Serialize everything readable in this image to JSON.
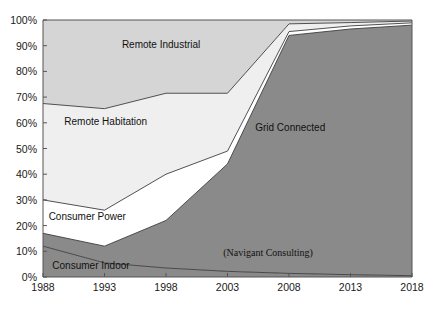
{
  "chart": {
    "source_note": "(Navigant Consulting)",
    "cut_off_title_fragment": "",
    "axes": {
      "y_ticks": [
        "0%",
        "10%",
        "20%",
        "30%",
        "40%",
        "50%",
        "60%",
        "70%",
        "80%",
        "90%",
        "100%"
      ],
      "x_ticks": [
        "1988",
        "1993",
        "1998",
        "2003",
        "2008",
        "2013",
        "2018"
      ],
      "xlim": [
        1988,
        2018
      ],
      "ylim": [
        0,
        100
      ],
      "grid": false
    },
    "series_labels": [
      {
        "name": "Remote Industrial",
        "x_pct": 32,
        "y_pct": 89
      },
      {
        "name": "Remote Habitation",
        "x_pct": 17,
        "y_pct": 59
      },
      {
        "name": "Consumer Power",
        "x_pct": 12,
        "y_pct": 22
      },
      {
        "name": "Consumer Indoor",
        "x_pct": 13,
        "y_pct": 3
      },
      {
        "name": "Grid Connected",
        "x_pct": 67,
        "y_pct": 57
      }
    ]
  },
  "chart_data": {
    "type": "area",
    "title": "",
    "subtitle": "",
    "xlabel": "",
    "ylabel": "",
    "stacked": true,
    "normalized": true,
    "xlim": [
      1988,
      2018
    ],
    "ylim": [
      0,
      100
    ],
    "grid": false,
    "legend": "inline-annotations",
    "annotations": [
      "(Navigant Consulting)"
    ],
    "x": [
      1988,
      1993,
      1998,
      2003,
      2008,
      2013,
      2018
    ],
    "xtick_labels": [
      "1988",
      "1993",
      "1998",
      "2003",
      "2008",
      "2013",
      "2018"
    ],
    "ytick_labels": [
      "0%",
      "10%",
      "20%",
      "30%",
      "40%",
      "50%",
      "60%",
      "70%",
      "80%",
      "90%",
      "100%"
    ],
    "series": [
      {
        "name": "Consumer Indoor",
        "color": "#8a8a8a",
        "values": [
          12,
          5.5,
          3.5,
          2.2,
          1.4,
          0.9,
          0.5
        ]
      },
      {
        "name": "Grid Connected",
        "color": "#8a8a8a",
        "values": [
          5,
          6.5,
          18.5,
          41.8,
          92.6,
          95.6,
          97.5
        ]
      },
      {
        "name": "Consumer Power",
        "color": "#ffffff",
        "values": [
          13,
          14,
          18,
          5,
          1.5,
          1.2,
          0.9
        ]
      },
      {
        "name": "Remote Habitation",
        "color": "#efefef",
        "values": [
          37.5,
          39.5,
          31.5,
          22.5,
          3.0,
          1.3,
          0.7
        ]
      },
      {
        "name": "Remote Industrial",
        "color": "#d5d5d5",
        "values": [
          32.5,
          34.5,
          28.5,
          28.5,
          1.5,
          1.0,
          0.4
        ]
      }
    ],
    "cumulative_tops": {
      "consumer_indoor": [
        12,
        5.5,
        3.5,
        2.2,
        1.4,
        0.9,
        0.5
      ],
      "grid_connected": [
        17,
        12,
        22,
        44,
        94,
        96.5,
        98
      ],
      "consumer_power": [
        30,
        26,
        40,
        49,
        95.5,
        97.7,
        98.9
      ],
      "remote_habitation": [
        67.5,
        65.5,
        71.5,
        71.5,
        98.5,
        99.0,
        99.6
      ],
      "remote_industrial": [
        100,
        100,
        100,
        100,
        100,
        100,
        100
      ]
    }
  },
  "style": {
    "remote_industrial_fill": "#d5d5d5",
    "remote_habitation_fill": "#efefef",
    "consumer_power_fill": "#ffffff",
    "grid_connected_fill": "#8a8a8a",
    "consumer_indoor_fill": "#8a8a8a",
    "line_color": "#3d3d3d",
    "axis_color": "#555555",
    "background": "#ffffff"
  }
}
